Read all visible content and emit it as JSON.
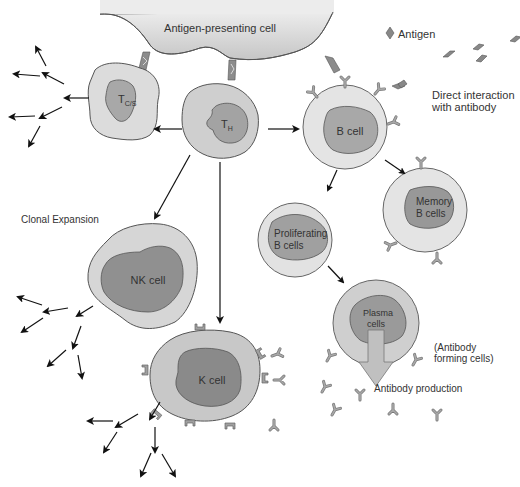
{
  "colors": {
    "background": "#ffffff",
    "outline": "#555555",
    "apc_fill": "#d4d4d4",
    "cytoplasm_light": "#e2e2e2",
    "cytoplasm_medium": "#c8c8c8",
    "nucleus_light": "#aaaaaa",
    "nucleus_dark": "#8e8e8e",
    "receptor": "#9a9a9a",
    "arrow": "#111111",
    "text": "#333333"
  },
  "labels": {
    "apc": "Antigen-presenting cell",
    "antigen_legend": "Antigen",
    "direct_interaction_line1": "Direct interaction",
    "direct_interaction_line2": "with antibody",
    "clonal_expansion": "Clonal Expansion",
    "tcs_main": "T",
    "tcs_sub": "C/S",
    "th_main": "T",
    "th_sub": "H",
    "b_cell": "B cell",
    "memory_line1": "Memory",
    "memory_line2": "B cells",
    "proliferating_line1": "Proliferating",
    "proliferating_line2": "B cells",
    "plasma_line1": "Plasma",
    "plasma_line2": "cells",
    "nk_cell": "NK cell",
    "k_cell": "K cell",
    "antibody_forming_line1": "(Antibody",
    "antibody_forming_line2": "forming cells)",
    "antibody_production": "Antibody production"
  },
  "nodes": [
    {
      "id": "apc",
      "label": "Antigen-presenting cell"
    },
    {
      "id": "tcs",
      "label": "T C/S"
    },
    {
      "id": "th",
      "label": "T H"
    },
    {
      "id": "b_cell",
      "label": "B cell"
    },
    {
      "id": "memory_b",
      "label": "Memory B cells"
    },
    {
      "id": "proliferating_b",
      "label": "Proliferating B cells"
    },
    {
      "id": "plasma",
      "label": "Plasma cells"
    },
    {
      "id": "nk",
      "label": "NK cell"
    },
    {
      "id": "k",
      "label": "K cell"
    }
  ],
  "edges": [
    {
      "from": "apc",
      "to": "tcs"
    },
    {
      "from": "apc",
      "to": "th"
    },
    {
      "from": "apc",
      "to": "b_cell"
    },
    {
      "from": "th",
      "to": "tcs"
    },
    {
      "from": "th",
      "to": "b_cell"
    },
    {
      "from": "th",
      "to": "nk"
    },
    {
      "from": "th",
      "to": "k"
    },
    {
      "from": "b_cell",
      "to": "proliferating_b"
    },
    {
      "from": "b_cell",
      "to": "memory_b"
    },
    {
      "from": "proliferating_b",
      "to": "plasma"
    },
    {
      "from": "plasma",
      "to": "antibody_production"
    }
  ]
}
